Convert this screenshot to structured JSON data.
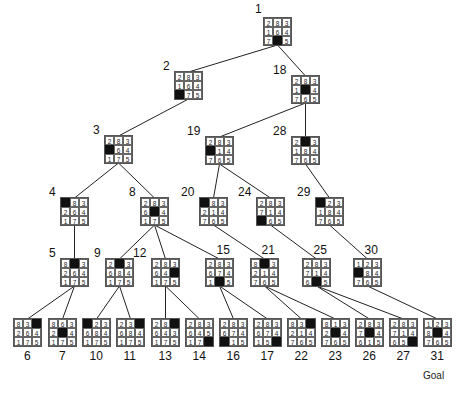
{
  "diagram": {
    "type": "8-puzzle search tree",
    "goal_label": "Goal",
    "nodes": [
      {
        "id": "1",
        "board": [
          [
            "2",
            "8",
            "3"
          ],
          [
            "1",
            "6",
            "4"
          ],
          [
            "7",
            "",
            "5"
          ]
        ],
        "x": 263,
        "y": 17,
        "label_pos": "top-left"
      },
      {
        "id": "2",
        "board": [
          [
            "2",
            "8",
            "3"
          ],
          [
            "1",
            "6",
            "4"
          ],
          [
            "",
            "7",
            "5"
          ]
        ],
        "x": 174,
        "y": 71,
        "label_pos": "left"
      },
      {
        "id": "18",
        "board": [
          [
            "2",
            "8",
            "3"
          ],
          [
            "1",
            "",
            "4"
          ],
          [
            "7",
            "6",
            "5"
          ]
        ],
        "x": 291,
        "y": 75,
        "label_pos": "left"
      },
      {
        "id": "3",
        "board": [
          [
            "2",
            "8",
            "3"
          ],
          [
            "",
            "6",
            "4"
          ],
          [
            "1",
            "7",
            "5"
          ]
        ],
        "x": 104,
        "y": 135,
        "label_pos": "left"
      },
      {
        "id": "19",
        "board": [
          [
            "2",
            "8",
            "3"
          ],
          [
            "",
            "1",
            "4"
          ],
          [
            "7",
            "6",
            "5"
          ]
        ],
        "x": 205,
        "y": 136,
        "label_pos": "left"
      },
      {
        "id": "28",
        "board": [
          [
            "2",
            "",
            "3"
          ],
          [
            "1",
            "8",
            "4"
          ],
          [
            "7",
            "6",
            "5"
          ]
        ],
        "x": 291,
        "y": 136,
        "label_pos": "left"
      },
      {
        "id": "4",
        "board": [
          [
            "",
            "8",
            "3"
          ],
          [
            "2",
            "6",
            "4"
          ],
          [
            "1",
            "7",
            "5"
          ]
        ],
        "x": 60,
        "y": 197,
        "label_pos": "left"
      },
      {
        "id": "8",
        "board": [
          [
            "2",
            "8",
            "3"
          ],
          [
            "6",
            "",
            "4"
          ],
          [
            "1",
            "7",
            "5"
          ]
        ],
        "x": 140,
        "y": 197,
        "label_pos": "left"
      },
      {
        "id": "20",
        "board": [
          [
            "",
            "8",
            "3"
          ],
          [
            "2",
            "1",
            "4"
          ],
          [
            "7",
            "6",
            "5"
          ]
        ],
        "x": 199,
        "y": 197,
        "label_pos": "left"
      },
      {
        "id": "24",
        "board": [
          [
            "2",
            "8",
            "3"
          ],
          [
            "7",
            "1",
            "4"
          ],
          [
            "",
            "6",
            "5"
          ]
        ],
        "x": 256,
        "y": 197,
        "label_pos": "left"
      },
      {
        "id": "29",
        "board": [
          [
            "",
            "2",
            "3"
          ],
          [
            "1",
            "8",
            "4"
          ],
          [
            "7",
            "6",
            "5"
          ]
        ],
        "x": 315,
        "y": 197,
        "label_pos": "left"
      },
      {
        "id": "5",
        "board": [
          [
            "8",
            "",
            "3"
          ],
          [
            "2",
            "6",
            "4"
          ],
          [
            "1",
            "7",
            "5"
          ]
        ],
        "x": 60,
        "y": 258,
        "label_pos": "left"
      },
      {
        "id": "9",
        "board": [
          [
            "2",
            "",
            "3"
          ],
          [
            "6",
            "8",
            "4"
          ],
          [
            "1",
            "7",
            "5"
          ]
        ],
        "x": 105,
        "y": 258,
        "label_pos": "left"
      },
      {
        "id": "12",
        "board": [
          [
            "2",
            "8",
            "3"
          ],
          [
            "6",
            "4",
            ""
          ],
          [
            "1",
            "7",
            "5"
          ]
        ],
        "x": 151,
        "y": 258,
        "label_pos": "left"
      },
      {
        "id": "15",
        "board": [
          [
            "2",
            "8",
            "3"
          ],
          [
            "6",
            "7",
            "4"
          ],
          [
            "1",
            "",
            "5"
          ]
        ],
        "x": 205,
        "y": 258,
        "label_pos": "top"
      },
      {
        "id": "21",
        "board": [
          [
            "8",
            "",
            "3"
          ],
          [
            "2",
            "1",
            "4"
          ],
          [
            "7",
            "6",
            "5"
          ]
        ],
        "x": 250,
        "y": 258,
        "label_pos": "top"
      },
      {
        "id": "25",
        "board": [
          [
            "2",
            "8",
            "3"
          ],
          [
            "7",
            "1",
            "4"
          ],
          [
            "6",
            "",
            "5"
          ]
        ],
        "x": 302,
        "y": 258,
        "label_pos": "top"
      },
      {
        "id": "30",
        "board": [
          [
            "1",
            "2",
            "3"
          ],
          [
            "",
            "8",
            "4"
          ],
          [
            "7",
            "6",
            "5"
          ]
        ],
        "x": 353,
        "y": 258,
        "label_pos": "top"
      },
      {
        "id": "6",
        "board": [
          [
            "8",
            "3",
            ""
          ],
          [
            "2",
            "6",
            "4"
          ],
          [
            "1",
            "7",
            "5"
          ]
        ],
        "x": 13,
        "y": 318,
        "label_pos": "bottom"
      },
      {
        "id": "7",
        "board": [
          [
            "8",
            "6",
            "3"
          ],
          [
            "2",
            "",
            "4"
          ],
          [
            "1",
            "7",
            "5"
          ]
        ],
        "x": 48,
        "y": 318,
        "label_pos": "bottom"
      },
      {
        "id": "10",
        "board": [
          [
            "",
            "2",
            "3"
          ],
          [
            "6",
            "8",
            "4"
          ],
          [
            "1",
            "7",
            "5"
          ]
        ],
        "x": 82,
        "y": 318,
        "label_pos": "bottom"
      },
      {
        "id": "11",
        "board": [
          [
            "2",
            "3",
            ""
          ],
          [
            "6",
            "8",
            "4"
          ],
          [
            "1",
            "7",
            "5"
          ]
        ],
        "x": 116,
        "y": 318,
        "label_pos": "bottom"
      },
      {
        "id": "13",
        "board": [
          [
            "2",
            "8",
            ""
          ],
          [
            "6",
            "4",
            "3"
          ],
          [
            "1",
            "7",
            "5"
          ]
        ],
        "x": 151,
        "y": 318,
        "label_pos": "bottom"
      },
      {
        "id": "14",
        "board": [
          [
            "2",
            "8",
            "3"
          ],
          [
            "6",
            "4",
            "5"
          ],
          [
            "1",
            "7",
            ""
          ]
        ],
        "x": 185,
        "y": 318,
        "label_pos": "bottom"
      },
      {
        "id": "16",
        "board": [
          [
            "2",
            "8",
            "3"
          ],
          [
            "6",
            "7",
            "4"
          ],
          [
            "",
            "1",
            "5"
          ]
        ],
        "x": 219,
        "y": 318,
        "label_pos": "bottom"
      },
      {
        "id": "17",
        "board": [
          [
            "2",
            "8",
            "3"
          ],
          [
            "6",
            "7",
            "4"
          ],
          [
            "1",
            "5",
            ""
          ]
        ],
        "x": 253,
        "y": 318,
        "label_pos": "bottom"
      },
      {
        "id": "22",
        "board": [
          [
            "8",
            "3",
            ""
          ],
          [
            "2",
            "1",
            "4"
          ],
          [
            "7",
            "6",
            "5"
          ]
        ],
        "x": 287,
        "y": 318,
        "label_pos": "bottom"
      },
      {
        "id": "23",
        "board": [
          [
            "8",
            "1",
            "3"
          ],
          [
            "2",
            "",
            "4"
          ],
          [
            "7",
            "6",
            "5"
          ]
        ],
        "x": 321,
        "y": 318,
        "label_pos": "bottom"
      },
      {
        "id": "26",
        "board": [
          [
            "2",
            "8",
            "3"
          ],
          [
            "7",
            "",
            "4"
          ],
          [
            "6",
            "1",
            "5"
          ]
        ],
        "x": 355,
        "y": 318,
        "label_pos": "bottom"
      },
      {
        "id": "27",
        "board": [
          [
            "2",
            "8",
            "3"
          ],
          [
            "7",
            "1",
            "4"
          ],
          [
            "6",
            "5",
            ""
          ]
        ],
        "x": 389,
        "y": 318,
        "label_pos": "bottom"
      },
      {
        "id": "31",
        "board": [
          [
            "1",
            "2",
            "3"
          ],
          [
            "8",
            "",
            "4"
          ],
          [
            "7",
            "6",
            "5"
          ]
        ],
        "x": 423,
        "y": 318,
        "label_pos": "bottom"
      }
    ],
    "edges": [
      [
        "1",
        "2"
      ],
      [
        "1",
        "18"
      ],
      [
        "2",
        "3"
      ],
      [
        "18",
        "19"
      ],
      [
        "18",
        "28"
      ],
      [
        "3",
        "4"
      ],
      [
        "3",
        "8"
      ],
      [
        "19",
        "20"
      ],
      [
        "19",
        "24"
      ],
      [
        "28",
        "29"
      ],
      [
        "4",
        "5"
      ],
      [
        "8",
        "9"
      ],
      [
        "8",
        "12"
      ],
      [
        "8",
        "15"
      ],
      [
        "20",
        "21"
      ],
      [
        "24",
        "25"
      ],
      [
        "29",
        "30"
      ],
      [
        "5",
        "6"
      ],
      [
        "5",
        "7"
      ],
      [
        "9",
        "10"
      ],
      [
        "9",
        "11"
      ],
      [
        "12",
        "13"
      ],
      [
        "12",
        "14"
      ],
      [
        "15",
        "16"
      ],
      [
        "15",
        "17"
      ],
      [
        "21",
        "22"
      ],
      [
        "21",
        "23"
      ],
      [
        "25",
        "26"
      ],
      [
        "25",
        "27"
      ],
      [
        "30",
        "31"
      ]
    ],
    "colors": {
      "blank": "#111111",
      "line": "#222222",
      "grid": "#666666"
    }
  }
}
